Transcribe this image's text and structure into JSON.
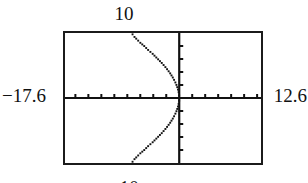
{
  "figure": {
    "kind": "graphing-calculator-screen",
    "caption_partial": "-10"
  },
  "window_labels": {
    "ymax": "10",
    "xmin": "−17.6",
    "xmax": "12.6",
    "ymin": "−10"
  },
  "colors": {
    "frame": "#1b1b1b",
    "axis": "#111111",
    "curve": "#141414",
    "background": "#ffffff",
    "text": "#111111"
  },
  "chart_data": {
    "type": "line",
    "title": "",
    "xlabel": "",
    "ylabel": "",
    "xlim": [
      -17.6,
      12.6
    ],
    "ylim": [
      -10,
      10
    ],
    "grid": false,
    "legend": null,
    "axes": {
      "x_axis_at_y": 0,
      "y_axis_at_x": 0,
      "x_tick_spacing": 2,
      "y_tick_spacing": 2,
      "x_ticks": [
        -16,
        -14,
        -12,
        -10,
        -8,
        -6,
        -4,
        -2,
        0,
        2,
        4,
        6,
        8,
        10,
        12
      ],
      "y_ticks": [
        -8,
        -6,
        -4,
        -2,
        0,
        2,
        4,
        6,
        8
      ],
      "tick_length_px": 4
    },
    "series": [
      {
        "name": "curve",
        "description": "leftward-opening sideways parabola passing through the origin",
        "style": "dotted-pixel-trace",
        "x": [
          -7.2,
          -6.9,
          -6.5,
          -6.0,
          -5.4,
          -4.8,
          -4.1,
          -3.4,
          -2.7,
          -2.0,
          -1.4,
          -0.9,
          -0.5,
          -0.25,
          -0.1,
          -0.02,
          0.0,
          -0.02,
          -0.1,
          -0.25,
          -0.5,
          -0.9,
          -1.4,
          -2.0,
          -2.7,
          -3.4,
          -4.1,
          -4.8,
          -5.4,
          -6.0,
          -6.5,
          -6.9,
          -7.2
        ],
        "y": [
          9.8,
          9.4,
          9.0,
          8.5,
          8.0,
          7.4,
          6.8,
          6.1,
          5.4,
          4.6,
          3.8,
          3.0,
          2.2,
          1.5,
          0.9,
          0.4,
          0.0,
          -0.4,
          -0.9,
          -1.5,
          -2.2,
          -3.0,
          -3.8,
          -4.6,
          -5.4,
          -6.1,
          -6.8,
          -7.4,
          -8.0,
          -8.5,
          -9.0,
          -9.4,
          -9.8
        ]
      }
    ]
  }
}
